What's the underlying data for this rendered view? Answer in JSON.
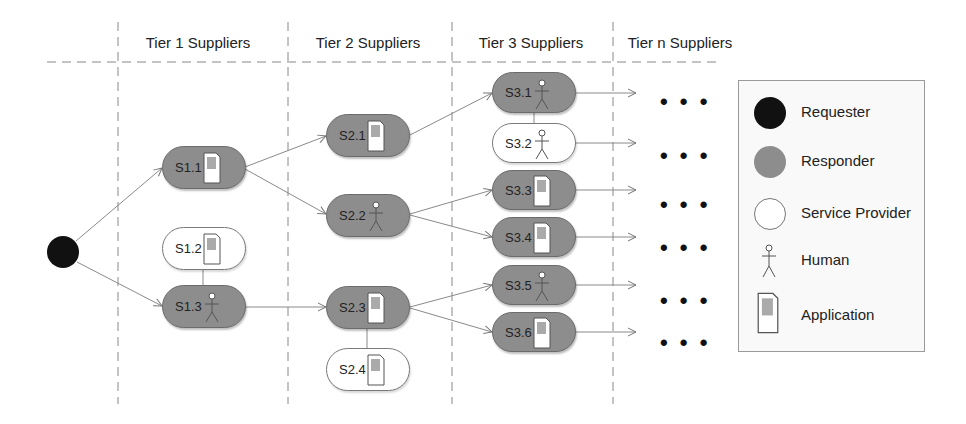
{
  "headers": [
    "Tier 1 Suppliers",
    "Tier 2 Suppliers",
    "Tier 3 Suppliers",
    "Tier n Suppliers"
  ],
  "requester": {
    "label": "Requester",
    "color": "#111111"
  },
  "nodes": [
    {
      "id": "S1.1",
      "label": "S1.1",
      "type": "responder",
      "icon": "application"
    },
    {
      "id": "S1.2",
      "label": "S1.2",
      "type": "service-provider",
      "icon": "application"
    },
    {
      "id": "S1.3",
      "label": "S1.3",
      "type": "responder",
      "icon": "human"
    },
    {
      "id": "S2.1",
      "label": "S2.1",
      "type": "responder",
      "icon": "application"
    },
    {
      "id": "S2.2",
      "label": "S2.2",
      "type": "responder",
      "icon": "human"
    },
    {
      "id": "S2.3",
      "label": "S2.3",
      "type": "responder",
      "icon": "application"
    },
    {
      "id": "S2.4",
      "label": "S2.4",
      "type": "service-provider",
      "icon": "application"
    },
    {
      "id": "S3.1",
      "label": "S3.1",
      "type": "responder",
      "icon": "human"
    },
    {
      "id": "S3.2",
      "label": "S3.2",
      "type": "service-provider",
      "icon": "human"
    },
    {
      "id": "S3.3",
      "label": "S3.3",
      "type": "responder",
      "icon": "application"
    },
    {
      "id": "S3.4",
      "label": "S3.4",
      "type": "responder",
      "icon": "application"
    },
    {
      "id": "S3.5",
      "label": "S3.5",
      "type": "responder",
      "icon": "human"
    },
    {
      "id": "S3.6",
      "label": "S3.6",
      "type": "responder",
      "icon": "application"
    }
  ],
  "edges": [
    {
      "from": "Requester",
      "to": "S1.1",
      "kind": "arrow"
    },
    {
      "from": "Requester",
      "to": "S1.3",
      "kind": "arrow"
    },
    {
      "from": "S1.1",
      "to": "S2.1",
      "kind": "arrow"
    },
    {
      "from": "S1.1",
      "to": "S2.2",
      "kind": "arrow"
    },
    {
      "from": "S1.3",
      "to": "S2.3",
      "kind": "arrow"
    },
    {
      "from": "S1.2",
      "to": "S1.3",
      "kind": "link"
    },
    {
      "from": "S2.1",
      "to": "S3.1",
      "kind": "arrow"
    },
    {
      "from": "S2.2",
      "to": "S3.3",
      "kind": "arrow"
    },
    {
      "from": "S2.2",
      "to": "S3.4",
      "kind": "arrow"
    },
    {
      "from": "S2.3",
      "to": "S3.5",
      "kind": "arrow"
    },
    {
      "from": "S2.3",
      "to": "S3.6",
      "kind": "arrow"
    },
    {
      "from": "S2.3",
      "to": "S2.4",
      "kind": "link"
    },
    {
      "from": "S3.1",
      "to": "S3.2",
      "kind": "link"
    }
  ],
  "continuation": "• • •",
  "legend": {
    "items": [
      {
        "label": "Requester",
        "icon": "black-circle"
      },
      {
        "label": "Responder",
        "icon": "gray-circle"
      },
      {
        "label": "Service Provider",
        "icon": "white-circle"
      },
      {
        "label": "Human",
        "icon": "stick-figure"
      },
      {
        "label": "Application",
        "icon": "phone-app"
      }
    ]
  },
  "colors": {
    "responder": "#8d8d8d",
    "service_provider": "#ffffff",
    "requester": "#111111",
    "line": "#8a8a8a"
  }
}
